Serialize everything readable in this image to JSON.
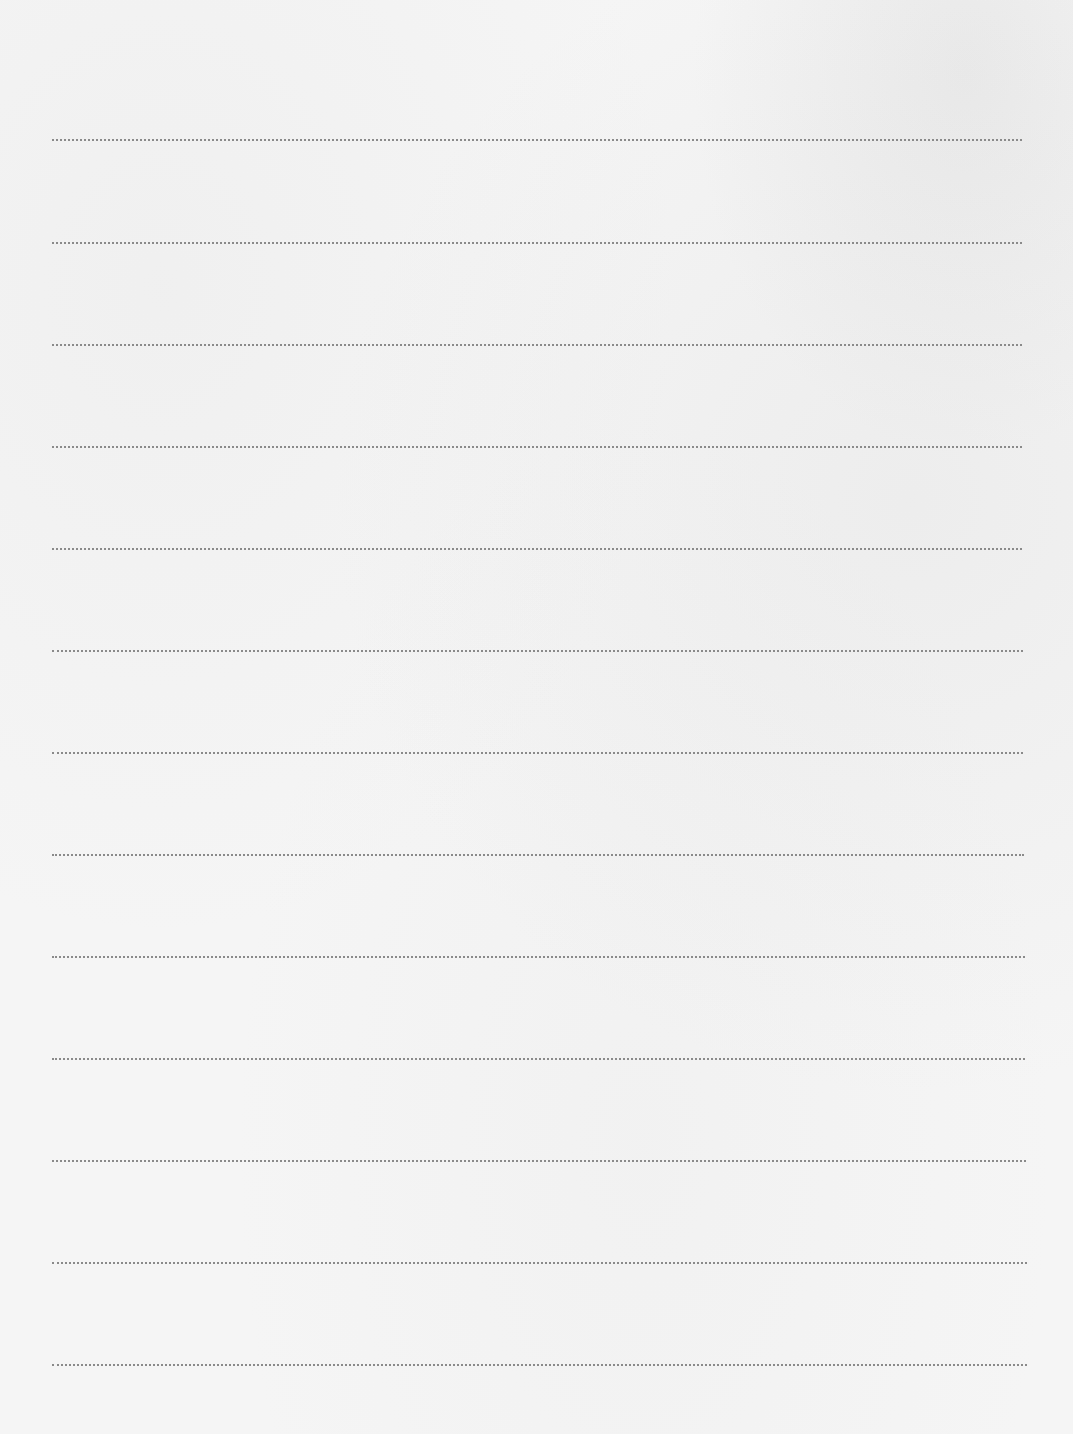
{
  "page": {
    "type": "blank lined writing sheet",
    "background_color": "#f4f4f4",
    "line_color": "#8a8a8a",
    "line_style": "dotted",
    "line_count": 13,
    "lines": [
      {
        "y": 139,
        "x1": 52,
        "x2": 1022
      },
      {
        "y": 242,
        "x1": 52,
        "x2": 1022
      },
      {
        "y": 344,
        "x1": 52,
        "x2": 1022
      },
      {
        "y": 446,
        "x1": 52,
        "x2": 1022
      },
      {
        "y": 548,
        "x1": 52,
        "x2": 1022
      },
      {
        "y": 650,
        "x1": 52,
        "x2": 1023
      },
      {
        "y": 752,
        "x1": 52,
        "x2": 1023
      },
      {
        "y": 854,
        "x1": 52,
        "x2": 1024
      },
      {
        "y": 956,
        "x1": 52,
        "x2": 1025
      },
      {
        "y": 1058,
        "x1": 52,
        "x2": 1025
      },
      {
        "y": 1160,
        "x1": 52,
        "x2": 1026
      },
      {
        "y": 1262,
        "x1": 52,
        "x2": 1027
      },
      {
        "y": 1364,
        "x1": 52,
        "x2": 1027
      }
    ]
  }
}
